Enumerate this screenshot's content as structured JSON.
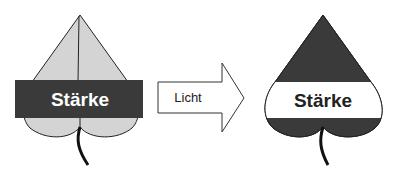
{
  "left_leaf": {
    "label": "Stärke",
    "leaf_color": "#d4d4d4",
    "band_color": "#3a3a3a",
    "label_color": "#ffffff"
  },
  "arrow": {
    "label": "Licht"
  },
  "right_leaf": {
    "label": "Stärke",
    "leaf_color": "#3a3a3a",
    "band_color": "#ffffff",
    "label_color": "#222222"
  }
}
